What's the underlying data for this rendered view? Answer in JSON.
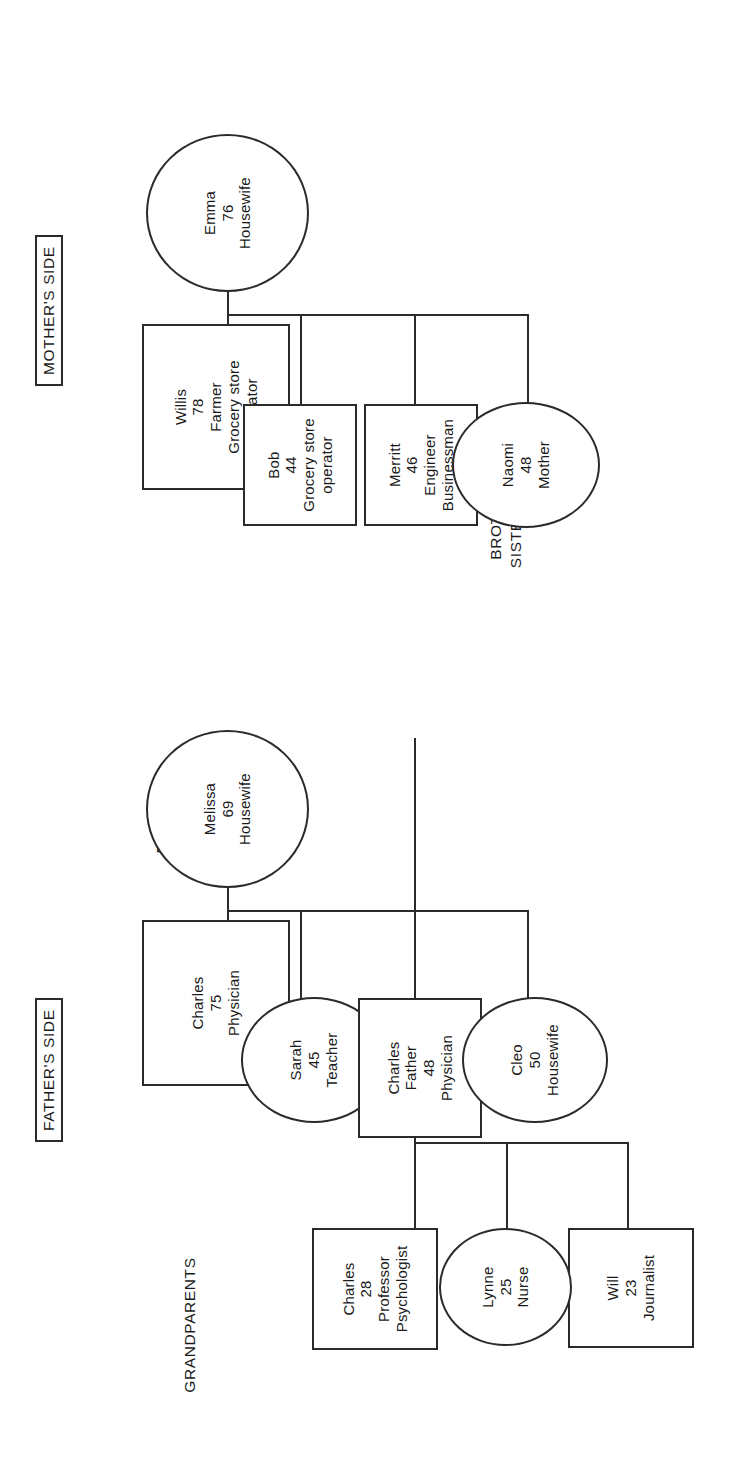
{
  "diagram": {
    "side_labels": {
      "mothers_side": "MOTHER'S SIDE",
      "fathers_side": "FATHER'S SIDE"
    },
    "generation_labels": {
      "grandparents": "GRANDPARENTS",
      "parents": "PARENTS,\nUNCLES, AND\nAUNTS IN BIRTH\nORDER",
      "siblings": "BROTHERS AND\nSISTERS IN BIRTH\nORDER"
    },
    "line_color": "#2b2b2b",
    "background_color": "#ffffff"
  },
  "people": {
    "mother_grandfather": {
      "name": "Willis",
      "age": "78",
      "role1": "Farmer",
      "role2": "Grocery store",
      "role3": "operator",
      "shape": "square",
      "generation": "grandparents",
      "side": "mothers"
    },
    "mother_grandmother": {
      "name": "Emma",
      "age": "76",
      "role1": "Housewife",
      "shape": "circle",
      "generation": "grandparents",
      "side": "mothers"
    },
    "father_grandfather": {
      "name": "Charles",
      "age": "75",
      "role1": "Physician",
      "shape": "square",
      "generation": "grandparents",
      "side": "fathers"
    },
    "father_grandmother": {
      "name": "Melissa",
      "age": "69",
      "role1": "Housewife",
      "shape": "circle",
      "generation": "grandparents",
      "side": "fathers"
    },
    "uncle_bob": {
      "name": "Bob",
      "age": "44",
      "role1": "Grocery store",
      "role2": "operator",
      "shape": "square",
      "generation": "parents",
      "side": "mothers"
    },
    "uncle_merritt": {
      "name": "Merritt",
      "age": "46",
      "role1": "Engineer",
      "role2": "Businessman",
      "shape": "square",
      "generation": "parents",
      "side": "mothers"
    },
    "mother_naomi": {
      "name": "Naomi",
      "age": "48",
      "role1": "Mother",
      "shape": "circle",
      "generation": "parents",
      "side": "mothers"
    },
    "aunt_sarah": {
      "name": "Sarah",
      "age": "45",
      "role1": "Teacher",
      "shape": "circle",
      "generation": "parents",
      "side": "fathers"
    },
    "father_charles": {
      "name": "Charles",
      "relation": "Father",
      "age": "48",
      "role1": "Physician",
      "shape": "square",
      "generation": "parents",
      "side": "fathers"
    },
    "aunt_cleo": {
      "name": "Cleo",
      "age": "50",
      "role1": "Housewife",
      "shape": "circle",
      "generation": "parents",
      "side": "fathers"
    },
    "sibling_will": {
      "name": "Will",
      "age": "23",
      "role1": "Journalist",
      "shape": "square",
      "generation": "siblings"
    },
    "sibling_lynne": {
      "name": "Lynne",
      "age": "25",
      "role1": "Nurse",
      "shape": "circle",
      "generation": "siblings"
    },
    "sibling_charles": {
      "name": "Charles",
      "age": "28",
      "role1": "Professor",
      "role2": "Psychologist",
      "shape": "square",
      "generation": "siblings"
    }
  }
}
